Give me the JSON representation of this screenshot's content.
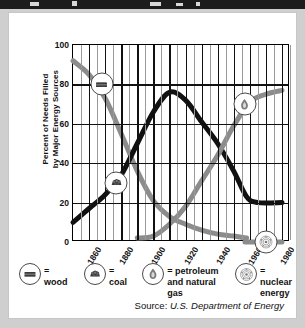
{
  "figure": {
    "source_label": "Source:",
    "source_value": "U.S. Department of Energy"
  },
  "legend": {
    "items": [
      {
        "key": "wood",
        "icon": "wood-log-icon",
        "eq": "=",
        "label": "wood"
      },
      {
        "key": "coal",
        "icon": "coal-lumps-icon",
        "eq": "=",
        "label": "coal"
      },
      {
        "key": "petro",
        "icon": "flame-icon",
        "eq": "=",
        "label": "petroleum\nand natural gas"
      },
      {
        "key": "nuclear",
        "icon": "atom-icon",
        "eq": "=",
        "label": "nuclear\nenergy"
      }
    ]
  },
  "chart_data": {
    "type": "line",
    "title": "",
    "xlabel": "",
    "ylabel": "Percent of Needs Filled by Major Energy Sources",
    "ylabel_line1": "Percent of Needs Filled",
    "ylabel_line2": "by Major Energy Sources",
    "xlim": [
      1850,
      1985
    ],
    "ylim": [
      0,
      100
    ],
    "yticks": [
      0,
      20,
      40,
      60,
      80,
      100
    ],
    "xticks": [
      1860,
      1880,
      1900,
      1920,
      1940,
      1960,
      1980
    ],
    "xtick_labels": [
      "1860",
      "1880",
      "1900",
      "1920",
      "1940",
      "1960",
      "1980"
    ],
    "ytick_labels": [
      "0",
      "20",
      "40",
      "60",
      "80",
      "100"
    ],
    "grid": "major vertical decade lines plus minor mid-decade lines; horizontal lines at every y tick",
    "legend_position": "below-plot",
    "colors": {
      "wood": "#8c8c8c",
      "coal": "#111111",
      "petroleum": "#8c8c8c",
      "nuclear": "#8c8c8c",
      "grid_major": "#111111",
      "grid_minor": "#9a9a9a",
      "background": "#ffffff",
      "card_border": "#c6c6c6",
      "page_background": "#cfcfcf",
      "top_strip": "#1c1c1c"
    },
    "series": [
      {
        "name": "wood",
        "color": "#8c8c8c",
        "marker_at": {
          "x": 1868,
          "y": 80
        },
        "points": [
          [
            1850,
            92
          ],
          [
            1860,
            85
          ],
          [
            1870,
            73
          ],
          [
            1880,
            55
          ],
          [
            1890,
            36
          ],
          [
            1900,
            21
          ],
          [
            1910,
            13
          ],
          [
            1920,
            9
          ],
          [
            1930,
            6
          ],
          [
            1940,
            4
          ],
          [
            1950,
            3
          ],
          [
            1958,
            2
          ]
        ]
      },
      {
        "name": "coal",
        "color": "#111111",
        "marker_at": {
          "x": 1877,
          "y": 30
        },
        "points": [
          [
            1850,
            10
          ],
          [
            1860,
            17
          ],
          [
            1870,
            24
          ],
          [
            1880,
            34
          ],
          [
            1890,
            50
          ],
          [
            1900,
            66
          ],
          [
            1910,
            76
          ],
          [
            1920,
            72
          ],
          [
            1930,
            61
          ],
          [
            1940,
            50
          ],
          [
            1950,
            36
          ],
          [
            1958,
            23
          ],
          [
            1965,
            20
          ],
          [
            1980,
            20
          ]
        ]
      },
      {
        "name": "petroleum and natural gas",
        "color": "#8c8c8c",
        "marker_at": {
          "x": 1957,
          "y": 70
        },
        "points": [
          [
            1890,
            2
          ],
          [
            1900,
            3
          ],
          [
            1910,
            9
          ],
          [
            1920,
            18
          ],
          [
            1930,
            31
          ],
          [
            1940,
            44
          ],
          [
            1950,
            59
          ],
          [
            1960,
            71
          ],
          [
            1970,
            75
          ],
          [
            1980,
            77
          ]
        ]
      },
      {
        "name": "nuclear energy",
        "color": "#8c8c8c",
        "marker_at": {
          "x": 1970,
          "y": 0
        },
        "points": [
          [
            1957,
            0
          ],
          [
            1980,
            0
          ]
        ]
      }
    ]
  }
}
